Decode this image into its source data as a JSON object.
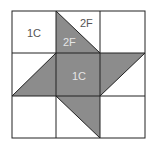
{
  "diagram": {
    "type": "quilt-block-grid",
    "grid": {
      "rows": 3,
      "cols": 3
    },
    "colors": {
      "shade": "#8c8c8c",
      "line": "#222222",
      "background": "#ffffff",
      "label_dark": "#555555",
      "label_light": "#e6e6e6"
    },
    "labels": {
      "top_left": "1C",
      "top_middle_upper": "2F",
      "top_middle_lower": "2F",
      "center": "1C"
    }
  }
}
